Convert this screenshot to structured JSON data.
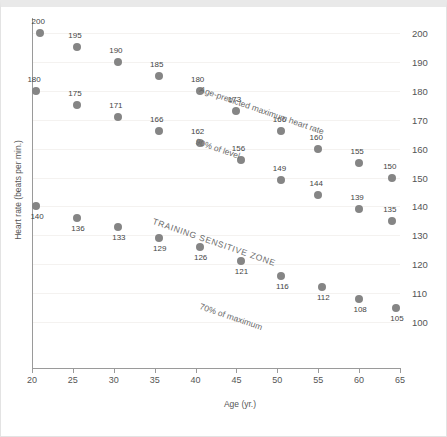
{
  "chart_data": {
    "type": "scatter",
    "title": "",
    "xlabel": "Age (yr.)",
    "ylabel": "Heart rate (beats per min.)",
    "xlim": [
      20,
      65
    ],
    "ylim": [
      100,
      200
    ],
    "xticks": [
      20,
      25,
      30,
      35,
      40,
      45,
      50,
      55,
      60,
      65
    ],
    "yticks": [
      100,
      110,
      120,
      130,
      140,
      150,
      160,
      170,
      180,
      190,
      200
    ],
    "y_axis_position": "right",
    "grid": true,
    "legend": "none",
    "series": [
      {
        "name": "Age-predicted maximum heart rate",
        "x": [
          21,
          25.5,
          30.5,
          35.5,
          40.5,
          45,
          50.5,
          55,
          60,
          64
        ],
        "values": [
          200,
          195,
          190,
          185,
          180,
          173,
          166,
          160,
          155,
          150
        ]
      },
      {
        "name": "90% of level",
        "x": [
          20.5,
          25.5,
          30.5,
          35.5,
          40.5,
          45.5,
          50.5,
          55,
          60,
          64
        ],
        "values": [
          180,
          175,
          171,
          166,
          162,
          156,
          149,
          144,
          139,
          135
        ]
      },
      {
        "name": "70% of maximum",
        "x": [
          20.5,
          25.5,
          30.5,
          35.5,
          40.5,
          45.5,
          50.5,
          55.5,
          60,
          64.5
        ],
        "values": [
          140,
          136,
          133,
          129,
          126,
          121,
          116,
          112,
          108,
          105
        ]
      }
    ],
    "annotations": [
      {
        "text": "Age-predicted maximum heart rate",
        "rotation": 19
      },
      {
        "text": "90% of level",
        "rotation": 19
      },
      {
        "text": "TRAINING SENSITIVE ZONE",
        "rotation": 19
      },
      {
        "text": "70% of maximum",
        "rotation": 19
      }
    ],
    "point_color": "#858585",
    "axis_color": "#9a9a9a",
    "grid_color": "#f4f2f0",
    "text_color": "#555555"
  },
  "axes": {
    "x_title": "Age (yr.)",
    "y_title": "Heart rate (beats per min.)",
    "x_tick_labels": [
      "20",
      "25",
      "30",
      "35",
      "40",
      "45",
      "50",
      "55",
      "60",
      "65"
    ],
    "y_tick_labels": [
      "200",
      "190",
      "180",
      "170",
      "160",
      "150",
      "140",
      "130",
      "120",
      "110",
      "100"
    ]
  },
  "annotations": {
    "max_hr": "Age-predicted maximum heart rate",
    "ninety_percent": "90% of level",
    "training_zone": "TRAINING SENSITIVE ZONE",
    "seventy_percent": "70% of maximum"
  },
  "point_labels": {
    "series_max": [
      "200",
      "195",
      "190",
      "185",
      "180",
      "173",
      "166",
      "160",
      "155",
      "150"
    ],
    "series_ninety": [
      "180",
      "175",
      "171",
      "166",
      "162",
      "156",
      "149",
      "144",
      "139",
      "135"
    ],
    "series_seventy": [
      "140",
      "136",
      "133",
      "129",
      "126",
      "121",
      "116",
      "112",
      "108",
      "105"
    ]
  }
}
